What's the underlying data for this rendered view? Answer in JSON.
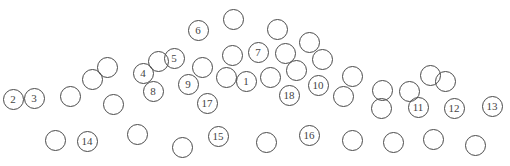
{
  "diagram": {
    "title": "",
    "stroke_color": "#4a4a4a",
    "label_color": "#444444",
    "background": "#ffffff",
    "default_radius": 10.5,
    "circles": [
      {
        "label": "2",
        "x": 13,
        "y": 99
      },
      {
        "label": "3",
        "x": 34,
        "y": 98
      },
      {
        "label": "",
        "x": 70,
        "y": 96
      },
      {
        "label": "",
        "x": 92,
        "y": 79
      },
      {
        "label": "",
        "x": 107,
        "y": 67
      },
      {
        "label": "",
        "x": 113,
        "y": 104
      },
      {
        "label": "4",
        "x": 143,
        "y": 73
      },
      {
        "label": "",
        "x": 158,
        "y": 61
      },
      {
        "label": "5",
        "x": 174,
        "y": 58
      },
      {
        "label": "8",
        "x": 153,
        "y": 91
      },
      {
        "label": "6",
        "x": 198,
        "y": 30
      },
      {
        "label": "",
        "x": 233,
        "y": 19
      },
      {
        "label": "9",
        "x": 188,
        "y": 84
      },
      {
        "label": "",
        "x": 202,
        "y": 67
      },
      {
        "label": "17",
        "x": 207,
        "y": 103
      },
      {
        "label": "",
        "x": 232,
        "y": 55
      },
      {
        "label": "",
        "x": 226,
        "y": 77
      },
      {
        "label": "1",
        "x": 246,
        "y": 81
      },
      {
        "label": "7",
        "x": 258,
        "y": 52
      },
      {
        "label": "",
        "x": 277,
        "y": 29
      },
      {
        "label": "",
        "x": 285,
        "y": 53
      },
      {
        "label": "",
        "x": 270,
        "y": 77
      },
      {
        "label": "",
        "x": 296,
        "y": 70
      },
      {
        "label": "18",
        "x": 289,
        "y": 95
      },
      {
        "label": "",
        "x": 309,
        "y": 42
      },
      {
        "label": "",
        "x": 322,
        "y": 59
      },
      {
        "label": "10",
        "x": 318,
        "y": 85
      },
      {
        "label": "",
        "x": 352,
        "y": 76
      },
      {
        "label": "",
        "x": 343,
        "y": 96
      },
      {
        "label": "",
        "x": 382,
        "y": 90
      },
      {
        "label": "",
        "x": 381,
        "y": 108
      },
      {
        "label": "",
        "x": 409,
        "y": 91
      },
      {
        "label": "11",
        "x": 418,
        "y": 107
      },
      {
        "label": "",
        "x": 430,
        "y": 75
      },
      {
        "label": "",
        "x": 445,
        "y": 81
      },
      {
        "label": "12",
        "x": 454,
        "y": 108
      },
      {
        "label": "13",
        "x": 492,
        "y": 106
      },
      {
        "label": "",
        "x": 55,
        "y": 140
      },
      {
        "label": "14",
        "x": 87,
        "y": 141
      },
      {
        "label": "",
        "x": 137,
        "y": 134
      },
      {
        "label": "",
        "x": 182,
        "y": 147
      },
      {
        "label": "15",
        "x": 218,
        "y": 136
      },
      {
        "label": "",
        "x": 266,
        "y": 142
      },
      {
        "label": "16",
        "x": 309,
        "y": 135
      },
      {
        "label": "",
        "x": 352,
        "y": 140
      },
      {
        "label": "",
        "x": 393,
        "y": 142
      },
      {
        "label": "",
        "x": 433,
        "y": 139
      },
      {
        "label": "",
        "x": 475,
        "y": 145
      }
    ]
  }
}
